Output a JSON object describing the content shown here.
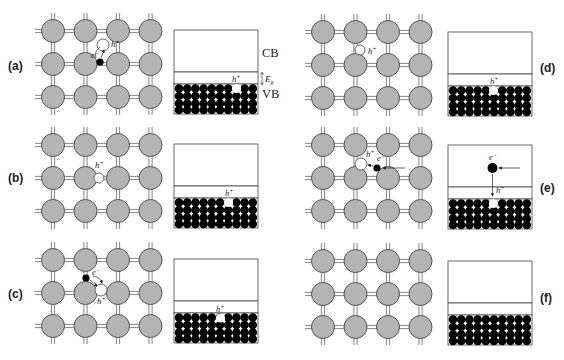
{
  "figure": {
    "panels": [
      {
        "id": "a",
        "label": "(a)",
        "lattice_events": [
          {
            "type": "electron",
            "symbol": "e⁻"
          },
          {
            "type": "hole",
            "symbol": "h⁺"
          }
        ],
        "band": {
          "cb_label": "CB",
          "vb_label": "VB",
          "gap_label": "E",
          "gap_sub": "g",
          "hole_label": "h⁺",
          "hole_col": 7
        }
      },
      {
        "id": "b",
        "label": "(b)",
        "lattice_events": [
          {
            "type": "hole",
            "symbol": "h⁺"
          }
        ],
        "band": {
          "hole_label": "h⁺",
          "hole_col": 6
        }
      },
      {
        "id": "c",
        "label": "(c)",
        "lattice_events": [
          {
            "type": "electron",
            "symbol": "e⁻"
          },
          {
            "type": "hole",
            "symbol": "h⁺"
          }
        ],
        "band": {
          "hole_label": "h⁺",
          "hole_col": 5
        }
      },
      {
        "id": "d",
        "label": "(d)",
        "lattice_events": [
          {
            "type": "hole",
            "symbol": "h⁺"
          }
        ],
        "band": {
          "hole_label": "h⁺",
          "hole_col": 5
        }
      },
      {
        "id": "e",
        "label": "(e)",
        "lattice_events": [
          {
            "type": "hole",
            "symbol": "h⁺"
          },
          {
            "type": "electron",
            "symbol": "e⁻"
          }
        ],
        "band": {
          "electron_label": "e⁻",
          "hole_label": "h⁺",
          "hole_col": 5
        }
      },
      {
        "id": "f",
        "label": "(f)",
        "lattice_events": [],
        "band": {}
      }
    ]
  },
  "labels": {
    "a": "(a)",
    "b": "(b)",
    "c": "(c)",
    "d": "(d)",
    "e": "e",
    "f": "(f)",
    "cb": "CB",
    "vb": "VB",
    "eg": "E",
    "eg_sub": "g",
    "h": "h",
    "plus": "+",
    "minus": "−"
  },
  "colors": {
    "atom": "#b4b4b4",
    "atom_stroke": "#555555",
    "bond": "#666666",
    "electron": "#000000",
    "hole": "#ffffff",
    "band_stroke": "#444444"
  }
}
